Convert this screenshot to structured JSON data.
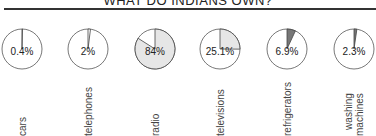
{
  "title": "WHAT DO INDIANS OWN?",
  "chart_data": {
    "type": "pie",
    "title": "WHAT DO INDIANS OWN?",
    "categories": [
      "cars",
      "telephones",
      "radio",
      "televisions",
      "refrigerators",
      "washing machines"
    ],
    "values": [
      0.4,
      2,
      84,
      25.1,
      6.9,
      2.3
    ],
    "value_labels": [
      "0.4%",
      "2%",
      "84%",
      "25.1%",
      "6.9%",
      "2.3%"
    ],
    "unit": "%",
    "layout": "small multiples, one pie per category, labels rotated vertically below",
    "fill_colors": [
      "#ffffff",
      "#ffffff",
      "#e6e6e6",
      "#e6e6e6",
      "#777777",
      "#777777"
    ]
  },
  "pies": [
    {
      "label": "cars",
      "value_label": "0.4%",
      "value": 0.4
    },
    {
      "label": "telephones",
      "value_label": "2%",
      "value": 2
    },
    {
      "label": "radio",
      "value_label": "84%",
      "value": 84
    },
    {
      "label": "televisions",
      "value_label": "25.1%",
      "value": 25.1
    },
    {
      "label": "refrigerators",
      "value_label": "6.9%",
      "value": 6.9
    },
    {
      "label": "washing\nmachines",
      "value_label": "2.3%",
      "value": 2.3
    }
  ]
}
